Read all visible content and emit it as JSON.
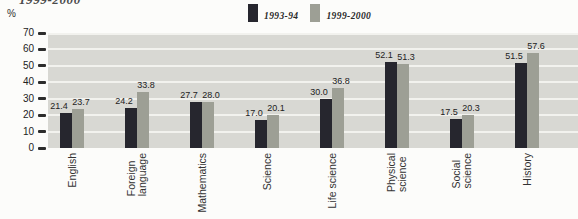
{
  "title_fragment": "1999-2000",
  "y_axis_unit": "%",
  "chart_data": {
    "type": "bar",
    "title": "",
    "categories": [
      "English",
      "Foreign language",
      "Mathematics",
      "Science",
      "Life science",
      "Physical science",
      "Social science",
      "History"
    ],
    "category_lines": [
      [
        "English"
      ],
      [
        "Foreign",
        "language"
      ],
      [
        "Mathematics"
      ],
      [
        "Science"
      ],
      [
        "Life science"
      ],
      [
        "Physical",
        "science"
      ],
      [
        "Social",
        "science"
      ],
      [
        "History"
      ]
    ],
    "series": [
      {
        "name": "1993-94",
        "color": "#26262e",
        "values": [
          21.4,
          24.2,
          27.7,
          17.0,
          30.0,
          52.1,
          17.5,
          51.5
        ]
      },
      {
        "name": "1999-2000",
        "color": "#9d9f95",
        "values": [
          23.7,
          33.8,
          28.0,
          20.1,
          36.8,
          51.3,
          20.3,
          57.6
        ]
      }
    ],
    "xlabel": "",
    "ylabel": "%",
    "ylim": [
      0,
      70
    ],
    "yticks": [
      0,
      10,
      20,
      30,
      40,
      50,
      60,
      70
    ],
    "grid": true,
    "legend_position": "top"
  },
  "colors": {
    "plot_bg": "#d8d8d3",
    "grid_line": "#f2f2ee",
    "series1": "#26262e",
    "series2": "#9d9f95",
    "text": "#2f2f2f"
  }
}
